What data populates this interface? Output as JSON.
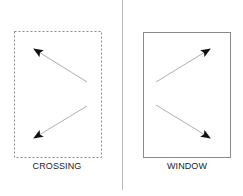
{
  "panels": [
    {
      "id": "crossing",
      "label": "CROSSING",
      "border_style": "dashed",
      "box": {
        "x": 14,
        "y": 31,
        "w": 87,
        "h": 126
      },
      "arrows": [
        {
          "direction": "up-left",
          "from": [
            87,
            82
          ],
          "to": [
            34,
            49
          ]
        },
        {
          "direction": "down-left",
          "from": [
            87,
            106
          ],
          "to": [
            34,
            138
          ]
        }
      ]
    },
    {
      "id": "window",
      "label": "WINDOW",
      "border_style": "solid",
      "box": {
        "x": 143,
        "y": 32,
        "w": 87,
        "h": 125
      },
      "arrows": [
        {
          "direction": "up-right",
          "from": [
            156,
            82
          ],
          "to": [
            210,
            49
          ]
        },
        {
          "direction": "down-right",
          "from": [
            156,
            105
          ],
          "to": [
            210,
            138
          ]
        }
      ]
    }
  ],
  "divider": {
    "x": 122,
    "y1": 0,
    "y2": 190
  },
  "colors": {
    "box_border": "#8a8a8a",
    "divider": "#b8b8b8",
    "arrow_line": "#9a9a9a",
    "arrow_head": "#111111",
    "label_text": "#222222"
  }
}
